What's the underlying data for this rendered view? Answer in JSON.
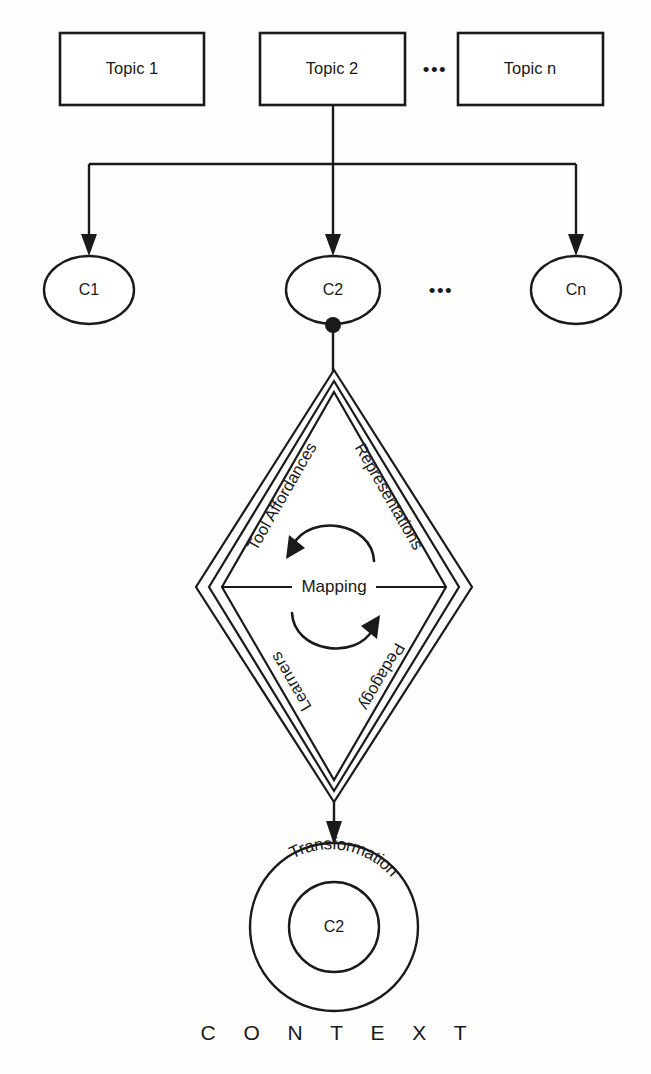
{
  "diagram": {
    "colors": {
      "stroke": "#1a1a1a",
      "background": "#fdfdfc",
      "fill": "#ffffff"
    },
    "topics": {
      "items": [
        {
          "label": "Topic 1"
        },
        {
          "label": "Topic 2"
        },
        {
          "label": "Topic n"
        }
      ],
      "ellipsis": "•••"
    },
    "concepts": {
      "items": [
        {
          "label": "C1"
        },
        {
          "label": "C2"
        },
        {
          "label": "Cn"
        }
      ],
      "ellipsis": "•••"
    },
    "diamond": {
      "center_label": "Mapping",
      "edges": [
        {
          "position": "upper-left",
          "label": "Tool Affordances"
        },
        {
          "position": "upper-right",
          "label": "Representations"
        },
        {
          "position": "lower-left",
          "label": "Learners"
        },
        {
          "position": "lower-right",
          "label": "Pedagogy"
        }
      ]
    },
    "transformation": {
      "outer_label": "Transformation",
      "inner_label": "C2"
    },
    "context_label": "C O N T E X T"
  }
}
